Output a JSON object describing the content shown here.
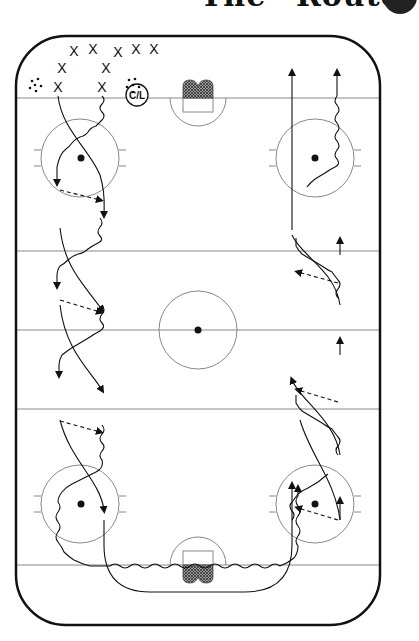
{
  "title": "The “Route”",
  "rink": {
    "board_color": "#111111",
    "line_color": "#888888",
    "net_fill": "#555555"
  },
  "labels": {
    "coach_marker": "C/L",
    "player_symbol": "X"
  },
  "players": [
    {
      "label": "X",
      "x": 74,
      "y": 51
    },
    {
      "label": "X",
      "x": 93,
      "y": 49
    },
    {
      "label": "X",
      "x": 118,
      "y": 52
    },
    {
      "label": "X",
      "x": 136,
      "y": 49
    },
    {
      "label": "X",
      "x": 154,
      "y": 49
    },
    {
      "label": "X",
      "x": 62,
      "y": 68
    },
    {
      "label": "X",
      "x": 106,
      "y": 68
    },
    {
      "label": "X",
      "x": 58,
      "y": 87
    },
    {
      "label": "X",
      "x": 102,
      "y": 87
    }
  ],
  "icons": {
    "puck_pile_left": "puck-pile-icon",
    "puck_pile_right": "puck-pile-icon",
    "net_top": "net-icon",
    "net_bottom": "net-icon"
  }
}
